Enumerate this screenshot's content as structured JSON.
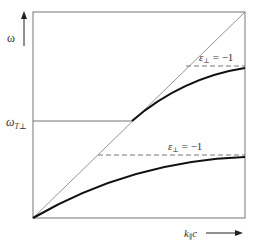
{
  "diagram": {
    "type": "dispersion-relation",
    "y_axis_label": "ω",
    "y_axis_symbol": "ω",
    "x_axis_label": "k∥c",
    "x_axis_main": "k",
    "x_axis_sub": "∥",
    "x_axis_tail": "c",
    "level_label": {
      "main": "ω",
      "sub": "T⊥"
    },
    "upper_asymptote_label": {
      "main": "ε",
      "sub": "⊥",
      "rhs": " = −1"
    },
    "lower_asymptote_label": {
      "main": "ε",
      "sub": "⊥",
      "rhs": " = −1"
    },
    "colors": {
      "frame": "#777777",
      "light_line": "#888888",
      "curve": "#111111",
      "dashed": "#777777",
      "text": "#333333"
    }
  }
}
